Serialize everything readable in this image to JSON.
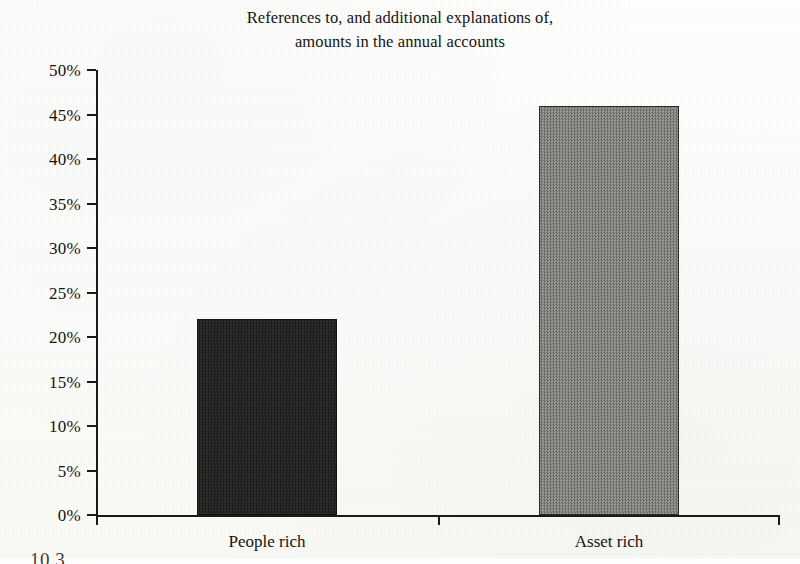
{
  "figure": {
    "title_line1": "References to, and additional explanations of,",
    "title_line2": "amounts in the annual accounts",
    "caption_partial": "10.3"
  },
  "chart_data": {
    "type": "bar",
    "title": "References to, and additional explanations of, amounts in the annual accounts",
    "categories": [
      "People rich",
      "Asset rich"
    ],
    "values": [
      22,
      46
    ],
    "value_labels": [
      "22%",
      "46%"
    ],
    "xlabel": "",
    "ylabel": "",
    "ylim": [
      0,
      50
    ],
    "ytick_step": 5,
    "ytick_labels": [
      "50%",
      "45%",
      "40%",
      "35%",
      "30%",
      "25%",
      "20%",
      "15%",
      "10%",
      "5%",
      "0%"
    ],
    "ytick_values": [
      50,
      45,
      40,
      35,
      30,
      25,
      20,
      15,
      10,
      5,
      0
    ],
    "grid": false,
    "legend": false,
    "series": [
      {
        "name": "People rich",
        "value": 22,
        "fill": "#272523",
        "fill_style": "dark-dither"
      },
      {
        "name": "Asset rich",
        "value": 46,
        "fill": "#848480",
        "fill_style": "gray-dither"
      }
    ],
    "axis_color": "#1b1a18",
    "background": "#fdfdfb"
  }
}
